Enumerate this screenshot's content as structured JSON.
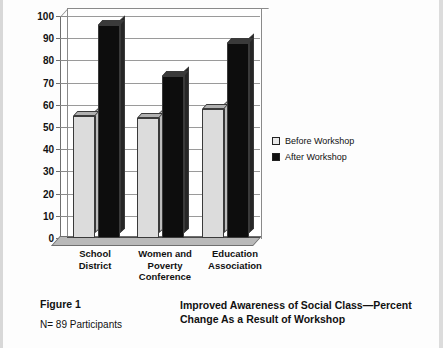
{
  "chart_data": {
    "type": "bar",
    "title": "",
    "xlabel": "",
    "ylabel": "",
    "ylim": [
      0,
      100
    ],
    "ytick_step": 10,
    "yticks": [
      100,
      90,
      80,
      70,
      60,
      50,
      40,
      30,
      20,
      10,
      0
    ],
    "grid": true,
    "legend_position": "right",
    "style": "3d-column",
    "categories": [
      "School District",
      "Women and Poverty Conference",
      "Education Association"
    ],
    "category_lines": [
      [
        "School",
        "District"
      ],
      [
        "Women and",
        "Poverty",
        "Conference"
      ],
      [
        "Education",
        "Association"
      ]
    ],
    "series": [
      {
        "name": "Before Workshop",
        "color": "#dcdcdc",
        "values": [
          55,
          54,
          58
        ]
      },
      {
        "name": "After Workshop",
        "color": "#0d0d0d",
        "values": [
          96,
          73,
          88
        ]
      }
    ]
  },
  "legend": {
    "items": [
      {
        "label": "Before Workshop",
        "marker": "light-square"
      },
      {
        "label": "After Workshop",
        "marker": "dark-square"
      }
    ]
  },
  "caption": {
    "figure_number": "Figure 1",
    "participants": "N= 89 Participants",
    "title_line_1": "Improved Awareness of Social Class—Percent",
    "title_line_2": "Change As a Result of Workshop"
  },
  "colors": {
    "before_bar": "#dcdcdc",
    "after_bar": "#0d0d0d",
    "axis": "#6f6f6f",
    "grid": "#9a9a9a",
    "floor": "#b9b9b9"
  }
}
